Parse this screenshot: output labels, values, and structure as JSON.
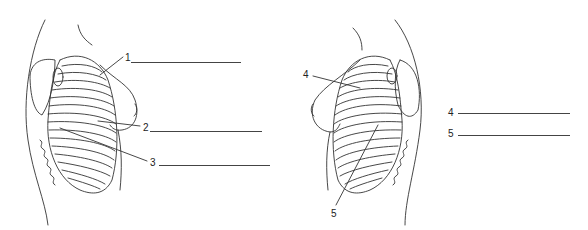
{
  "figure": {
    "left_view": {
      "description": "Lateral view of thoracic cage with breast (left side)",
      "labels": [
        {
          "number": "1",
          "x": 125,
          "y": 53
        },
        {
          "number": "2",
          "x": 143,
          "y": 123
        },
        {
          "number": "3",
          "x": 150,
          "y": 158
        }
      ],
      "answer_lines": [
        {
          "x1": 131,
          "x2": 241,
          "y": 62
        },
        {
          "x1": 150,
          "x2": 262,
          "y": 131
        },
        {
          "x1": 159,
          "x2": 270,
          "y": 165
        }
      ],
      "artist_mark": "JRS"
    },
    "right_view": {
      "description": "Lateral view of thoracic cage with breast (right side)",
      "labels": [
        {
          "number": "4",
          "x": 303,
          "y": 70
        },
        {
          "number": "5",
          "x": 331,
          "y": 209
        }
      ],
      "answer_labels": [
        {
          "number": "4",
          "x": 448,
          "y": 108
        },
        {
          "number": "5",
          "x": 448,
          "y": 129
        }
      ],
      "answer_lines": [
        {
          "x1": 458,
          "x2": 570,
          "y": 113
        },
        {
          "x1": 458,
          "x2": 570,
          "y": 135
        }
      ]
    }
  },
  "colors": {
    "ink": "#333333",
    "background": "#ffffff"
  }
}
